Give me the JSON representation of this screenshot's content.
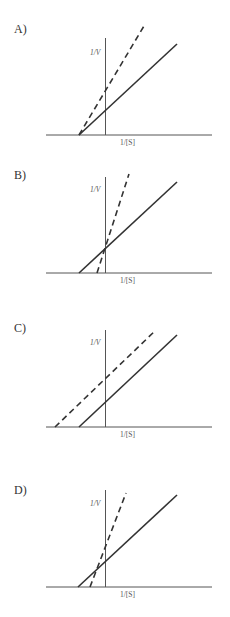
{
  "header": {
    "cut_off_text": ""
  },
  "panels": [
    {
      "label": "A)",
      "y_axis_label": "1/V",
      "x_axis_label": "1/[S]",
      "offset_y": 0,
      "axis_y": 135,
      "vaxis_top": 38,
      "solid": [
        79,
        135,
        177,
        44
      ],
      "dashed": [
        79,
        135,
        144,
        26
      ]
    },
    {
      "label": "B)",
      "y_axis_label": "1/V",
      "x_axis_label": "1/[S]",
      "offset_y": 150,
      "axis_y": 273,
      "vaxis_top": 177,
      "solid": [
        79,
        273,
        177,
        182
      ],
      "dashed": [
        97,
        273,
        129,
        174
      ]
    },
    {
      "label": "C)",
      "y_axis_label": "1/V",
      "x_axis_label": "1/[S]",
      "offset_y": 300,
      "axis_y": 427,
      "vaxis_top": 330,
      "solid": [
        79,
        427,
        177,
        335
      ],
      "dashed": [
        55,
        427,
        156,
        330
      ]
    },
    {
      "label": "D)",
      "y_axis_label": "1/V",
      "x_axis_label": "1/[S]",
      "offset_y": 450,
      "axis_y": 587,
      "vaxis_top": 490,
      "solid": [
        78,
        587,
        177,
        495
      ],
      "dashed": [
        90,
        587,
        126,
        493
      ]
    }
  ],
  "legend": {
    "solid_line": "no inhibitor (solid)",
    "dashed_line": "with inhibitor (dashed)"
  },
  "colors": {
    "line": "#333333",
    "axis": "#555555",
    "background": "#ffffff"
  }
}
